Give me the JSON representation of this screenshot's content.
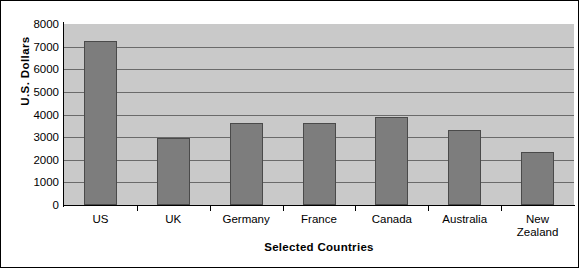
{
  "chart_data": {
    "type": "bar",
    "title": "",
    "subtitle": "",
    "xlabel": "Selected Countries",
    "ylabel": "U.S. Dollars",
    "categories": [
      "US",
      "UK",
      "Germany",
      "France",
      "Canada",
      "Australia",
      "New Zealand"
    ],
    "values": [
      7250,
      2980,
      3630,
      3620,
      3900,
      3300,
      2350
    ],
    "ylim": [
      0,
      8000
    ],
    "yticks": [
      0,
      1000,
      2000,
      3000,
      4000,
      5000,
      6000,
      7000,
      8000
    ],
    "ytick_labels": [
      "0",
      "1000",
      "2000",
      "3000",
      "4000",
      "5000",
      "6000",
      "7000",
      "8000"
    ],
    "grid": true,
    "legend": false,
    "legend_position": "none",
    "bar_color": "#7d7d7d",
    "bar_border_color": "#4a4a4a",
    "plot_background": "#c9c9c9",
    "gridline_color": "#6a6a6a",
    "axis_color": "#000000",
    "figure_background": "#ffffff",
    "figure_border_color": "#000000"
  },
  "category_label_lines": [
    [
      "US"
    ],
    [
      "UK"
    ],
    [
      "Germany"
    ],
    [
      "France"
    ],
    [
      "Canada"
    ],
    [
      "Australia"
    ],
    [
      "New",
      "Zealand"
    ]
  ]
}
